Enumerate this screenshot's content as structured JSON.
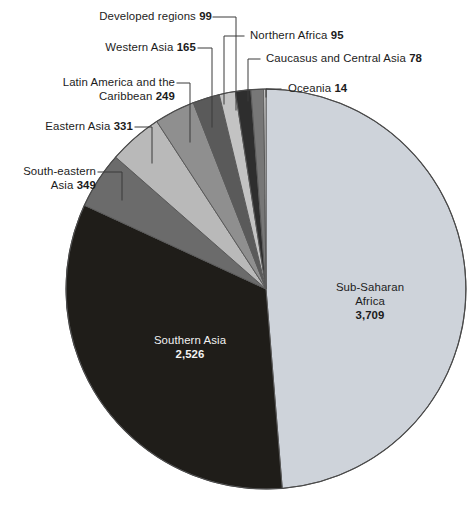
{
  "figure": {
    "background_color": "#ffffff",
    "pie": {
      "center_x": 266,
      "center_y": 289,
      "radius": 200,
      "start_angle_deg": -90,
      "outline_color": "#555555"
    }
  },
  "chart_data": {
    "type": "pie",
    "title": "",
    "xlabel": "",
    "ylabel": "",
    "total": 7615,
    "units": "thousands",
    "legend_position": "callout-labels",
    "grid": false,
    "categories": [
      "Sub-Saharan Africa",
      "Southern Asia",
      "South-eastern Asia",
      "Eastern Asia",
      "Latin America and the Caribbean",
      "Western Asia",
      "Developed regions",
      "Northern Africa",
      "Caucasus and Central Asia",
      "Oceania"
    ],
    "values": [
      3709,
      2526,
      349,
      331,
      249,
      165,
      99,
      95,
      78,
      14
    ],
    "value_labels": [
      "3,709",
      "2,526",
      "349",
      "331",
      "249",
      "165",
      "99",
      "95",
      "78",
      "14"
    ],
    "colors": [
      "#ced3da",
      "#1f1d19",
      "#6b6b6b",
      "#b9b9b9",
      "#8f8f8f",
      "#5a5a5a",
      "#c3c3c3",
      "#2e2e2e",
      "#777777",
      "#e0e0e0"
    ],
    "slices": [
      {
        "label": "Sub-Saharan Africa",
        "value": 3709,
        "value_label": "3,709",
        "color": "#ced3da"
      },
      {
        "label": "Southern Asia",
        "value": 2526,
        "value_label": "2,526",
        "color": "#1f1d19"
      },
      {
        "label": "South-eastern Asia",
        "value": 349,
        "value_label": "349",
        "color": "#6b6b6b"
      },
      {
        "label": "Eastern Asia",
        "value": 331,
        "value_label": "331",
        "color": "#b9b9b9"
      },
      {
        "label": "Latin America and the Caribbean",
        "value": 249,
        "value_label": "249",
        "color": "#8f8f8f"
      },
      {
        "label": "Western Asia",
        "value": 165,
        "value_label": "165",
        "color": "#5a5a5a"
      },
      {
        "label": "Developed regions",
        "value": 99,
        "value_label": "99",
        "color": "#c3c3c3"
      },
      {
        "label": "Northern Africa",
        "value": 95,
        "value_label": "95",
        "color": "#2e2e2e"
      },
      {
        "label": "Caucasus and Central Asia",
        "value": 78,
        "value_label": "78",
        "color": "#777777"
      },
      {
        "label": "Oceania",
        "value": 14,
        "value_label": "14",
        "color": "#e0e0e0"
      }
    ]
  },
  "callouts": {
    "developed_regions": {
      "name": "Developed regions",
      "value": "99"
    },
    "northern_africa": {
      "name": "Northern Africa",
      "value": "95"
    },
    "western_asia": {
      "name": "Western Asia",
      "value": "165"
    },
    "caucasus_central_asia": {
      "name": "Caucasus and Central Asia",
      "value": "78"
    },
    "latin_america_line1": "Latin America and the",
    "latin_america_line2": "Caribbean",
    "latin_america_value": "249",
    "oceania": {
      "name": "Oceania",
      "value": "14"
    },
    "eastern_asia": {
      "name": "Eastern Asia",
      "value": "331"
    },
    "south_eastern_asia_line1": "South-eastern",
    "south_eastern_asia_line2": "Asia",
    "south_eastern_asia_value": "349"
  },
  "inslice_labels": {
    "sub_saharan": {
      "line1": "Sub-Saharan",
      "line2": "Africa",
      "value": "3,709"
    },
    "southern_asia": {
      "line1": "Southern Asia",
      "value": "2,526"
    }
  }
}
